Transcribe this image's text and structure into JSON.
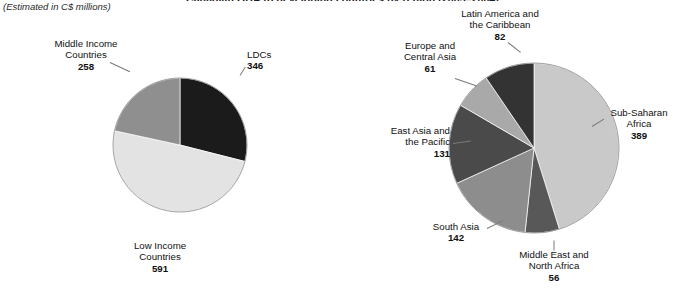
{
  "header": {
    "title_clipped": "Canadian ODA to developing countries by region (2003–2004)",
    "subtitle": "(Estimated in C$ millions)"
  },
  "chart_data": [
    {
      "type": "pie",
      "name": "oda-by-income-group",
      "title": "",
      "unit": "C$ millions",
      "total": 1195,
      "start_angle_deg": 0,
      "direction": "clockwise",
      "slices": [
        {
          "label": "LDCs",
          "value": 346,
          "color": "#1b1b1b",
          "label_pos": "right"
        },
        {
          "label": "Low Income Countries",
          "value": 591,
          "color": "#e3e3e3",
          "label_pos": "bottom"
        },
        {
          "label": "Middle Income Countries",
          "value": 258,
          "color": "#8f8f8f",
          "label_pos": "top-left"
        }
      ]
    },
    {
      "type": "pie",
      "name": "oda-by-region",
      "title": "",
      "unit": "C$ millions",
      "total": 861,
      "start_angle_deg": 0,
      "direction": "clockwise",
      "slices": [
        {
          "label": "Sub-Saharan Africa",
          "value": 389,
          "color": "#c9c9c9",
          "label_pos": "right"
        },
        {
          "label": "Middle East and North Africa",
          "value": 56,
          "color": "#585858",
          "label_pos": "bottom"
        },
        {
          "label": "South Asia",
          "value": 142,
          "color": "#8d8d8d",
          "label_pos": "bottom-left"
        },
        {
          "label": "East Asia and the Pacific",
          "value": 131,
          "color": "#4a4a4a",
          "label_pos": "left"
        },
        {
          "label": "Europe and Central Asia",
          "value": 61,
          "color": "#a9a9a9",
          "label_pos": "top-left"
        },
        {
          "label": "Latin America and the Caribbean",
          "value": 82,
          "color": "#333333",
          "label_pos": "top"
        }
      ]
    }
  ],
  "labels": {
    "left": {
      "ldcs_name": "LDCs",
      "ldcs_value": "346",
      "low_name_1": "Low Income",
      "low_name_2": "Countries",
      "low_value": "591",
      "mid_name_1": "Middle Income",
      "mid_name_2": "Countries",
      "mid_value": "258"
    },
    "right": {
      "ssa_name_1": "Sub-Saharan",
      "ssa_name_2": "Africa",
      "ssa_value": "389",
      "mena_name_1": "Middle East and",
      "mena_name_2": "North Africa",
      "mena_value": "56",
      "sa_name": "South Asia",
      "sa_value": "142",
      "eap_name_1": "East Asia and",
      "eap_name_2": "the Pacific",
      "eap_value": "131",
      "eca_name_1": "Europe and",
      "eca_name_2": "Central Asia",
      "eca_value": "61",
      "lac_name_1": "Latin America and",
      "lac_name_2": "the Caribbean",
      "lac_value": "82"
    }
  }
}
